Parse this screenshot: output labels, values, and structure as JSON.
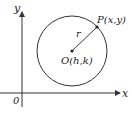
{
  "diagram": {
    "axes": {
      "x_label": "x",
      "y_label": "y",
      "origin_label": "0"
    },
    "circle": {
      "center_label": "O(h,k)",
      "point_label": "P(x,y)",
      "radius_label": "r"
    },
    "colors": {
      "stroke": "#333333",
      "background": "#ffffff"
    }
  }
}
